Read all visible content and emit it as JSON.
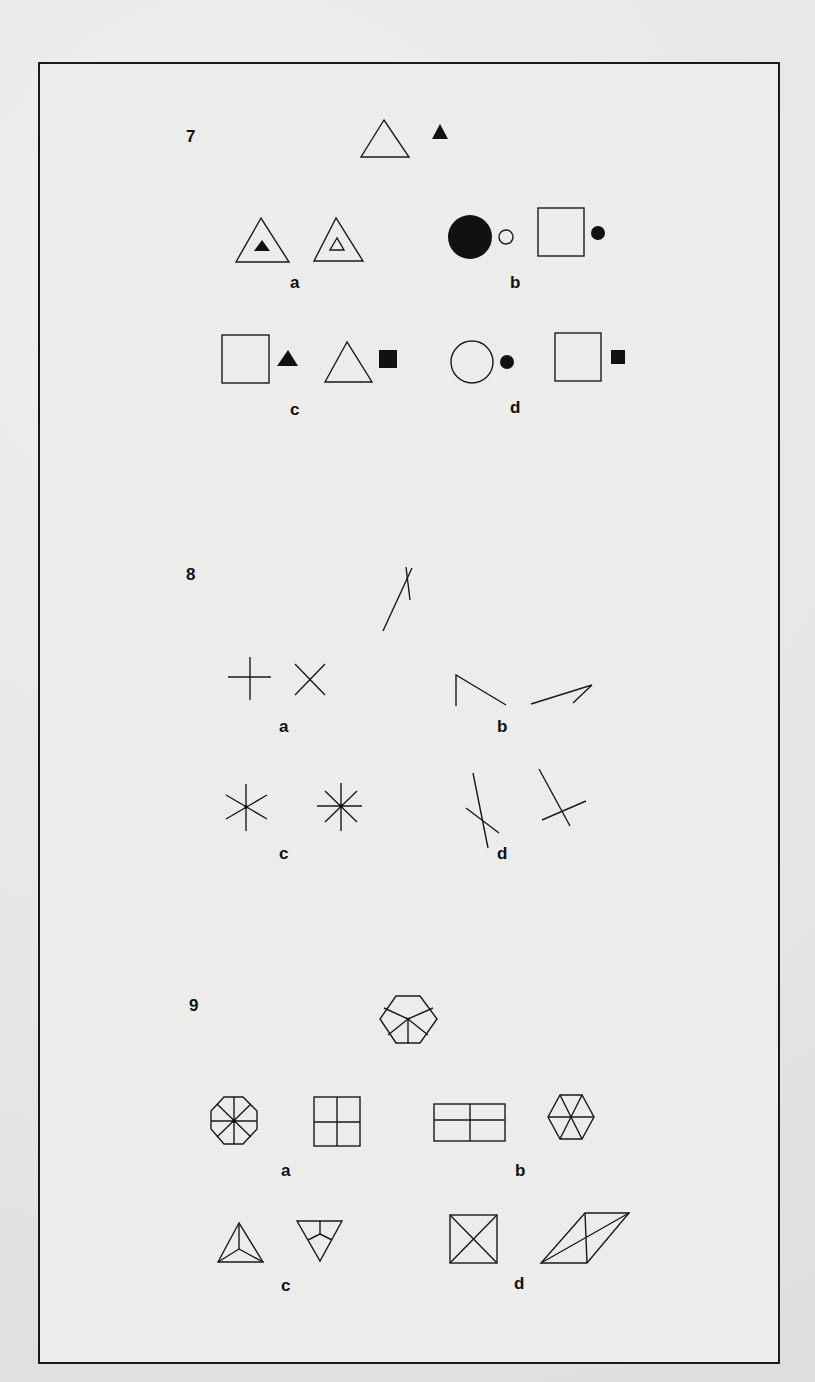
{
  "problems": [
    {
      "number": "7",
      "stem": "outline triangle with small solid triangle",
      "options": [
        {
          "label": "a",
          "description": "triangle containing solid triangle; triangle containing outline triangle"
        },
        {
          "label": "b",
          "description": "large solid circle with small outline circle; outline square with small solid circle"
        },
        {
          "label": "c",
          "description": "outline square with small solid triangle; outline triangle with small solid square"
        },
        {
          "label": "d",
          "description": "outline circle with small solid circle; outline square with small solid square"
        }
      ]
    },
    {
      "number": "8",
      "stem": "long line crossed by short line near top",
      "options": [
        {
          "label": "a",
          "description": "plus sign; X sign"
        },
        {
          "label": "b",
          "description": "open angle shape; narrow angle shape"
        },
        {
          "label": "c",
          "description": "six-armed asterisk; eight-armed asterisk"
        },
        {
          "label": "d",
          "description": "long line crossed by short line near bottom; long line crossed by short line near bottom (rotated)"
        }
      ]
    },
    {
      "number": "9",
      "stem": "hexagon divided into five sections from center",
      "options": [
        {
          "label": "a",
          "description": "octagon divided into eight sections; square divided into four"
        },
        {
          "label": "b",
          "description": "rectangle divided into four; hexagon divided into six triangles"
        },
        {
          "label": "c",
          "description": "triangle divided into three from center; inverted triangle divided into three"
        },
        {
          "label": "d",
          "description": "square with both diagonals; parallelogram with both diagonals"
        }
      ]
    }
  ],
  "colors": {
    "ink": "#1a1a1a",
    "paper": "#ececea"
  }
}
